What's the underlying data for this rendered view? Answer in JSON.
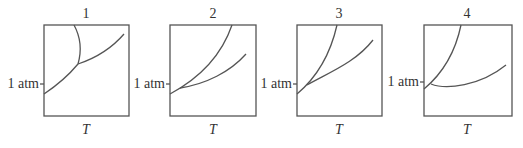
{
  "figure": {
    "panels": [
      {
        "title": "1",
        "pressure_label": "1 atm",
        "x_axis_label": "T"
      },
      {
        "title": "2",
        "pressure_label": "1 atm",
        "x_axis_label": "T"
      },
      {
        "title": "3",
        "pressure_label": "1 atm",
        "x_axis_label": "T"
      },
      {
        "title": "4",
        "pressure_label": "1 atm",
        "x_axis_label": "T"
      }
    ],
    "line_color": "#555555"
  }
}
